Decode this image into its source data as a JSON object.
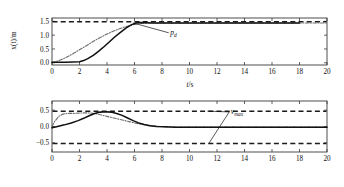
{
  "figure": {
    "panels": [
      {
        "id": "position",
        "ylabel_main": "x(t)/m",
        "xlabel_var": "t",
        "xlabel_unit": "/s",
        "annotation": {
          "label": "p",
          "sub": "d"
        }
      },
      {
        "id": "velocity",
        "ylabel_main": "ẋ(t)/(m/s)",
        "xlabel_var": "t",
        "xlabel_unit": "/s",
        "annotation": {
          "label": "v",
          "sub": "max"
        }
      }
    ]
  },
  "chart_data": [
    {
      "type": "line",
      "id": "position-plot",
      "title": "",
      "xlabel": "t/s",
      "ylabel": "x(t)/m",
      "xlim": [
        0,
        20
      ],
      "ylim": [
        -0.08,
        1.62
      ],
      "xticks": [
        0,
        2,
        4,
        6,
        8,
        10,
        12,
        14,
        16,
        18,
        20
      ],
      "xtick_labels": [
        "0",
        "2",
        "4",
        "6",
        "8",
        "10",
        "12",
        "14",
        "16",
        "18",
        "20"
      ],
      "yticks": [
        0.0,
        0.5,
        1.0,
        1.5
      ],
      "ytick_labels": [
        "0.0",
        "0.5",
        "1.0",
        "1.5"
      ],
      "grid": false,
      "legend": "none",
      "reference_lines": [
        {
          "name": "p_d",
          "style": "dashed",
          "y": 1.48,
          "color": "#1a1a1a"
        }
      ],
      "annotations": [
        {
          "text": "p_d",
          "x": 8.6,
          "y": 1.03,
          "points_to": {
            "x": 5.9,
            "y": 1.44
          }
        }
      ],
      "series": [
        {
          "name": "reference trajectory",
          "style": "dash-dot",
          "color": "#6e6e6e",
          "x": [
            0,
            0.4,
            0.8,
            1.2,
            1.6,
            2.0,
            2.4,
            2.8,
            3.2,
            3.6,
            4.0,
            4.4,
            4.8,
            5.2,
            5.6,
            6.0,
            6.4,
            7.0,
            8.0,
            10.0,
            12.0,
            14.0,
            16.0,
            18.0,
            20.0
          ],
          "y": [
            0.0,
            0.06,
            0.14,
            0.24,
            0.35,
            0.47,
            0.59,
            0.71,
            0.83,
            0.94,
            1.04,
            1.13,
            1.21,
            1.28,
            1.34,
            1.39,
            1.42,
            1.44,
            1.44,
            1.44,
            1.44,
            1.44,
            1.44,
            1.44,
            1.44
          ]
        },
        {
          "name": "actual trajectory",
          "style": "solid",
          "color": "#111111",
          "x": [
            0,
            0.5,
            1.0,
            1.5,
            2.0,
            2.3,
            2.6,
            3.0,
            3.4,
            3.8,
            4.2,
            4.6,
            5.0,
            5.4,
            5.8,
            6.1,
            6.4,
            6.8,
            7.4,
            8.0,
            10.0,
            12.0,
            14.0,
            16.0,
            18.0,
            20.0
          ],
          "y": [
            0.02,
            0.02,
            0.02,
            0.03,
            0.04,
            0.08,
            0.15,
            0.27,
            0.42,
            0.59,
            0.77,
            0.95,
            1.11,
            1.26,
            1.38,
            1.44,
            1.46,
            1.45,
            1.44,
            1.44,
            1.44,
            1.44,
            1.44,
            1.44,
            1.44
          ]
        }
      ]
    },
    {
      "type": "line",
      "id": "velocity-plot",
      "title": "",
      "xlabel": "t/s",
      "ylabel": "ẋ(t)/(m/s)",
      "xlim": [
        0,
        20
      ],
      "ylim": [
        -0.78,
        0.78
      ],
      "xticks": [
        0,
        2,
        4,
        6,
        8,
        10,
        12,
        14,
        16,
        18,
        20
      ],
      "xtick_labels": [
        "0",
        "2",
        "4",
        "6",
        "8",
        "10",
        "12",
        "14",
        "16",
        "18",
        "20"
      ],
      "yticks": [
        -0.5,
        0.0,
        0.5
      ],
      "ytick_labels": [
        "−0.5",
        "0.0",
        "0.5"
      ],
      "grid": false,
      "legend": "none",
      "reference_lines": [
        {
          "name": "v_max_upper",
          "style": "dashed",
          "y": 0.47,
          "color": "#1a1a1a"
        },
        {
          "name": "v_max_lower",
          "style": "dashed",
          "y": -0.52,
          "color": "#1a1a1a"
        }
      ],
      "annotations": [
        {
          "text": "v_max",
          "x": 13.0,
          "y": 0.4,
          "points_to": [
            {
              "x": 11.3,
              "y": 0.47
            },
            {
              "x": 11.4,
              "y": -0.52
            }
          ]
        }
      ],
      "series": [
        {
          "name": "reference velocity",
          "style": "dash-dot",
          "color": "#6e6e6e",
          "x": [
            0,
            0.2,
            0.5,
            0.8,
            1.1,
            1.5,
            2.0,
            2.4,
            2.8,
            3.2,
            3.6,
            4.0,
            4.4,
            4.8,
            5.2,
            5.6,
            6.0,
            6.5,
            7.0,
            7.6,
            8.2,
            9.0,
            10.0,
            12.0,
            14.0,
            16.0,
            18.0,
            20.0
          ],
          "y": [
            0.0,
            0.16,
            0.31,
            0.38,
            0.4,
            0.4,
            0.41,
            0.42,
            0.41,
            0.39,
            0.35,
            0.31,
            0.27,
            0.23,
            0.19,
            0.15,
            0.11,
            0.07,
            0.04,
            0.01,
            -0.01,
            -0.02,
            -0.02,
            -0.02,
            -0.02,
            -0.02,
            -0.02,
            -0.02
          ]
        },
        {
          "name": "actual velocity",
          "style": "solid",
          "color": "#111111",
          "x": [
            0,
            0.4,
            0.9,
            1.4,
            1.9,
            2.3,
            2.7,
            3.1,
            3.5,
            3.9,
            4.3,
            4.7,
            5.1,
            5.5,
            5.9,
            6.3,
            6.7,
            7.1,
            7.6,
            8.2,
            9.0,
            10.0,
            12.0,
            14.0,
            16.0,
            18.0,
            20.0
          ],
          "y": [
            -0.04,
            0.0,
            0.05,
            0.11,
            0.18,
            0.25,
            0.33,
            0.4,
            0.44,
            0.45,
            0.44,
            0.4,
            0.34,
            0.26,
            0.18,
            0.11,
            0.06,
            0.02,
            0.0,
            -0.01,
            -0.02,
            -0.02,
            -0.02,
            -0.02,
            -0.02,
            -0.02,
            -0.02
          ]
        }
      ]
    }
  ]
}
